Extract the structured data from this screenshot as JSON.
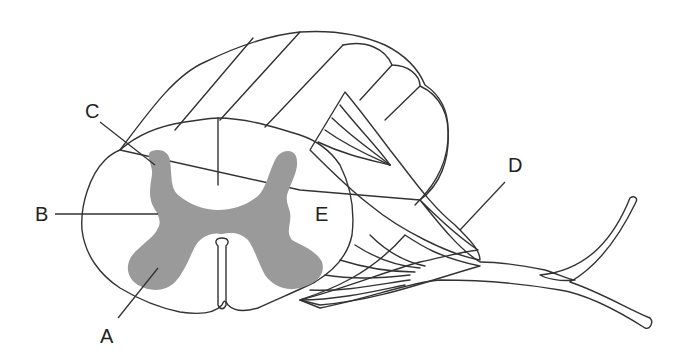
{
  "diagram": {
    "colors": {
      "background": "#ffffff",
      "white_matter": "#fbfbfb",
      "grey_matter": "#9a9a9a",
      "segments": "#ececec",
      "outline": "#333333"
    },
    "labels": [
      {
        "id": "A",
        "text": "A"
      },
      {
        "id": "B",
        "text": "B"
      },
      {
        "id": "C",
        "text": "C"
      },
      {
        "id": "D",
        "text": "D"
      },
      {
        "id": "E",
        "text": "E"
      }
    ]
  }
}
